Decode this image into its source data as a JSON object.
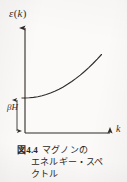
{
  "figure": {
    "y_axis_label": "ε(k)",
    "y_axis_label_main": "ε",
    "y_axis_label_paren_open": "(",
    "y_axis_label_var": "k",
    "y_axis_label_paren_close": ")",
    "x_axis_label": "k",
    "gap_label": "βH",
    "ink_color": "#2f2b27",
    "paper_color": "#fbfaf8"
  },
  "caption": {
    "figure_number": "図4.4",
    "line1_text": "マグノンの",
    "line2_text": "エネルギー・スペ",
    "line3_text": "クトル",
    "full_text": "図4.4 マグノンのエネルギー・スペクトル"
  },
  "chart_data": {
    "type": "line",
    "xlabel": "k",
    "ylabel": "ε(k)",
    "xlim": [
      0,
      1
    ],
    "ylim": [
      0,
      1
    ],
    "grid": false,
    "legend": false,
    "annotations": [
      {
        "name": "energy-gap",
        "label": "βH",
        "description": "double-headed vertical arrow from origin to the k=0 curve value marking the magnon energy gap",
        "y_from": 0,
        "y_to": 0.35
      }
    ],
    "series": [
      {
        "name": "magnon dispersion ε(k) = βH + Dk²",
        "x": [
          0.0,
          0.05,
          0.1,
          0.15,
          0.2,
          0.25,
          0.3,
          0.35,
          0.4,
          0.45,
          0.5,
          0.55,
          0.6,
          0.65,
          0.7,
          0.75,
          0.8,
          0.85,
          0.9
        ],
        "y": [
          0.35,
          0.352,
          0.356,
          0.363,
          0.373,
          0.385,
          0.4,
          0.418,
          0.438,
          0.461,
          0.487,
          0.515,
          0.546,
          0.579,
          0.615,
          0.654,
          0.695,
          0.739,
          0.785
        ]
      }
    ]
  }
}
